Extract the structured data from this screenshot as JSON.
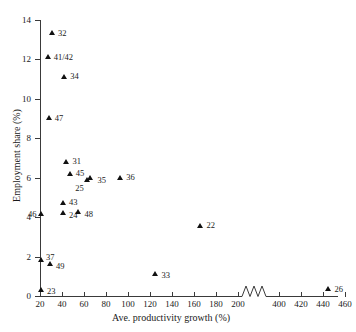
{
  "chart_data": {
    "type": "scatter",
    "title": "",
    "xlabel": "Ave. productivity growth (%)",
    "ylabel": "Employment share (%)",
    "xlim": [
      10,
      470
    ],
    "ylim": [
      0,
      14
    ],
    "grid": false,
    "legend": "none",
    "axis_break": {
      "present": true,
      "from": 210,
      "to": 390
    },
    "xticks": [
      20,
      40,
      60,
      80,
      100,
      120,
      140,
      160,
      180,
      200,
      400,
      420,
      440,
      460
    ],
    "xticklabels": [
      "20",
      "40",
      "60",
      "80",
      "100",
      "120",
      "140",
      "160",
      "180",
      "200",
      "400",
      "420",
      "440",
      "460"
    ],
    "yticks": [
      0,
      2,
      4,
      6,
      8,
      10,
      12,
      14
    ],
    "yticklabels": [
      "0",
      "2",
      "4",
      "6",
      "8",
      "10",
      "12",
      "14"
    ],
    "marker": "triangle",
    "marker_color": "#111111",
    "points": [
      {
        "label": "32",
        "x": 31,
        "y": 13.2
      },
      {
        "label": "41/42",
        "x": 27,
        "y": 12.0
      },
      {
        "label": "34",
        "x": 42,
        "y": 11.0
      },
      {
        "label": "47",
        "x": 28,
        "y": 8.9
      },
      {
        "label": "31",
        "x": 44,
        "y": 6.7
      },
      {
        "label": "45",
        "x": 47,
        "y": 6.1
      },
      {
        "label": "25",
        "x": 63,
        "y": 5.8
      },
      {
        "label": "35",
        "x": 66,
        "y": 5.9
      },
      {
        "label": "36",
        "x": 93,
        "y": 5.9
      },
      {
        "label": "46",
        "x": 21,
        "y": 4.05
      },
      {
        "label": "43",
        "x": 41,
        "y": 4.6
      },
      {
        "label": "24",
        "x": 41,
        "y": 4.1
      },
      {
        "label": "48",
        "x": 55,
        "y": 4.15
      },
      {
        "label": "37",
        "x": 21,
        "y": 1.75
      },
      {
        "label": "49",
        "x": 29,
        "y": 1.5
      },
      {
        "label": "22",
        "x": 166,
        "y": 3.45
      },
      {
        "label": "33",
        "x": 125,
        "y": 1.0
      },
      {
        "label": "23",
        "x": 21,
        "y": 0.2
      },
      {
        "label": "26",
        "x": 445,
        "y": 0.25
      }
    ]
  }
}
